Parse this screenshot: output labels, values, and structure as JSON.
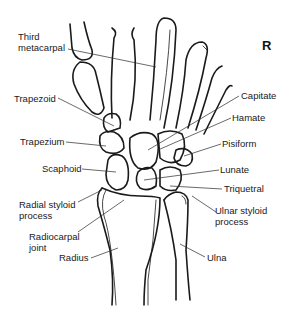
{
  "diagram": {
    "side_marker": "R",
    "labels": {
      "third_metacarpal": [
        "Third",
        "metacarpal"
      ],
      "trapezoid": "Trapezoid",
      "trapezium": "Trapezium",
      "scaphoid": "Scaphoid",
      "radial_styloid": [
        "Radial styloid",
        "process"
      ],
      "radiocarpal_joint": [
        "Radiocarpal",
        "joint"
      ],
      "radius": "Radius",
      "capitate": "Capitate",
      "hamate": "Hamate",
      "pisiform": "Pisiform",
      "lunate": "Lunate",
      "triquetral": "Triquetral",
      "ulnar_styloid": [
        "Ulnar styloid",
        "process"
      ],
      "ulna": "Ulna"
    },
    "colors": {
      "line": "#1a1a1a",
      "background": "#ffffff"
    }
  }
}
